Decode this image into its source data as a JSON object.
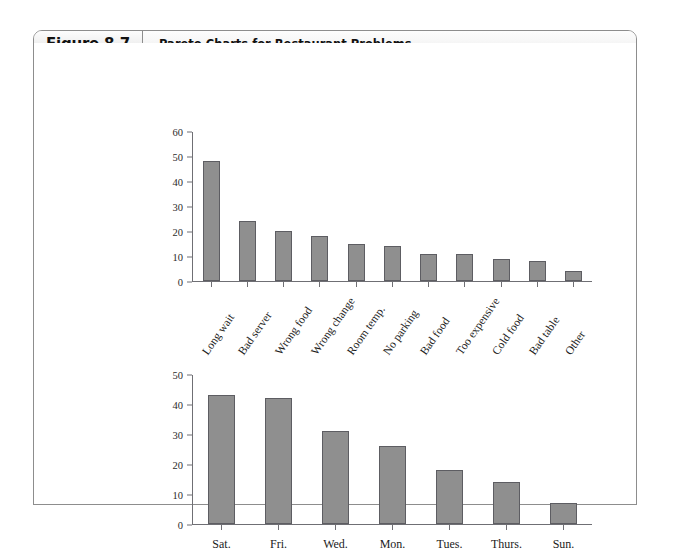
{
  "figure": {
    "number": "Figure 8.7",
    "title": "Pareto Charts for Restaurant Problems"
  },
  "colors": {
    "bar_fill": "#8f8f8f",
    "bar_stroke": "#5d5d62",
    "axis": "#6f6f74",
    "frame": "#8d8d8d"
  },
  "chart_data": [
    {
      "type": "bar",
      "title": "",
      "xlabel": "",
      "ylabel": "",
      "ylim": [
        0,
        60
      ],
      "yticks": [
        0,
        10,
        20,
        30,
        40,
        50,
        60
      ],
      "grid": false,
      "legend": "none",
      "categories": [
        "Long wait",
        "Bad server",
        "Wrong food",
        "Wrong change",
        "Room temp.",
        "No parking",
        "Bad food",
        "Too expensive",
        "Cold food",
        "Bad table",
        "Other"
      ],
      "values": [
        48,
        24,
        20,
        18,
        15,
        14,
        11,
        11,
        9,
        8,
        4
      ]
    },
    {
      "type": "bar",
      "title": "",
      "xlabel": "",
      "ylabel": "",
      "ylim": [
        0,
        50
      ],
      "yticks": [
        0,
        10,
        20,
        30,
        40,
        50
      ],
      "grid": false,
      "legend": "none",
      "categories": [
        "Sat.",
        "Fri.",
        "Wed.",
        "Mon.",
        "Tues.",
        "Thurs.",
        "Sun."
      ],
      "values": [
        43,
        42,
        31,
        26,
        18,
        14,
        7
      ]
    }
  ]
}
